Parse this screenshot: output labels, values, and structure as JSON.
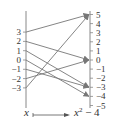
{
  "diagram": {
    "type": "mapping-diagram",
    "function_label": "x ↦ x² − 4",
    "caption": {
      "input": "x",
      "output_base": "x",
      "output_exp": "2",
      "output_tail": " − 4"
    },
    "domain_values": [
      "3",
      "2",
      "1",
      "0",
      "−1",
      "−2",
      "−3"
    ],
    "range_values": [
      "5",
      "4",
      "3",
      "2",
      "1",
      "0",
      "−1",
      "−2",
      "−3",
      "−4",
      "−5"
    ],
    "mappings": [
      {
        "from": 3,
        "to": 5
      },
      {
        "from": 2,
        "to": 0
      },
      {
        "from": 1,
        "to": -3
      },
      {
        "from": 0,
        "to": -4
      },
      {
        "from": -1,
        "to": -3
      },
      {
        "from": -2,
        "to": 0
      },
      {
        "from": -3,
        "to": 5
      }
    ],
    "colors": {
      "axis": "#888888",
      "arrow": "#777777",
      "text": "#333333"
    }
  }
}
